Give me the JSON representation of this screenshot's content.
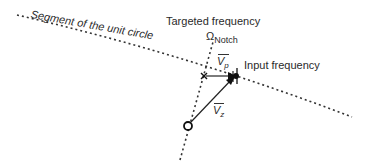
{
  "labels": {
    "unit_circle": "Segment of the unit circle",
    "targeted": "Targeted frequency",
    "omega_symbol": "Ω",
    "omega_sub": "Notch",
    "input": "Input frequency",
    "vp_symbol": "V",
    "vp_sub": "p",
    "vz_symbol": "V",
    "vz_sub": "z"
  },
  "colors": {
    "line": "#333333",
    "background": "#ffffff"
  }
}
